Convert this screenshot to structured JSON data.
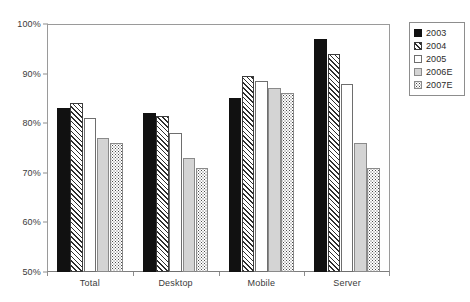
{
  "chart_data": {
    "type": "bar",
    "title": "",
    "xlabel": "",
    "ylabel": "",
    "categories": [
      "Total",
      "Desktop",
      "Mobile",
      "Server"
    ],
    "series": [
      {
        "name": "2003",
        "pattern": "solid-black",
        "values": [
          83,
          82,
          85,
          97
        ]
      },
      {
        "name": "2004",
        "pattern": "diagonal-hatch",
        "values": [
          84,
          81.5,
          89.5,
          94
        ]
      },
      {
        "name": "2005",
        "pattern": "white-empty",
        "values": [
          81,
          78,
          88.5,
          88
        ]
      },
      {
        "name": "2006E",
        "pattern": "light-gray",
        "values": [
          77,
          73,
          87,
          76
        ]
      },
      {
        "name": "2007E",
        "pattern": "fine-dotted",
        "values": [
          76,
          71,
          86,
          71
        ]
      }
    ],
    "ylim": [
      50,
      100
    ],
    "ytick_values": [
      50,
      60,
      70,
      80,
      90,
      100
    ],
    "ytick_labels": [
      "50%",
      "60%",
      "70%",
      "80%",
      "90%",
      "100%"
    ],
    "grid": false,
    "legend_position": "right-outside",
    "legend_entries": [
      "2003",
      "2004",
      "2005",
      "2006E",
      "2007E"
    ],
    "colors": {
      "series_2003": "#111111",
      "series_2004": "#2e2e2e",
      "series_2005": "#ffffff",
      "series_2006E": "#d4d4d4",
      "series_2007E": "#4a4a4a",
      "axis": "#8d8d8d",
      "text": "#3a3a3a",
      "background": "#ffffff"
    }
  }
}
